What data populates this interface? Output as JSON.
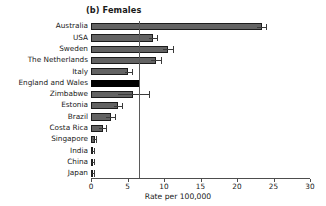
{
  "figure": {
    "panel_title": "(b) Females",
    "background_color": "#ffffff"
  },
  "chart_data": {
    "type": "bar",
    "orientation": "horizontal",
    "title": "(b) Females",
    "xlabel": "Rate  per 100,000",
    "ylabel": "",
    "xlim": [
      0,
      30
    ],
    "xticks": [
      0,
      5,
      10,
      15,
      20,
      25,
      30
    ],
    "xticklabels": [
      "0",
      "5",
      "10",
      "15",
      "20",
      "25",
      "30"
    ],
    "grid": false,
    "legend": false,
    "reference_line": {
      "value": 6.6,
      "orientation": "vertical",
      "color": "#5a5a5a",
      "label": "England and Wales rate"
    },
    "bar_color": "#636363",
    "highlight_color": "#000000",
    "highlight_category": "England and Wales",
    "categories": [
      "Australia",
      "USA",
      "Sweden",
      "The Netherlands",
      "Italy",
      "England and Wales",
      "Zimbabwe",
      "Estonia",
      "Brazil",
      "Costa Rica",
      "Singapore",
      "India",
      "China",
      "Japan"
    ],
    "values": [
      23.4,
      8.5,
      10.6,
      8.9,
      5.1,
      6.6,
      5.8,
      3.7,
      2.7,
      1.6,
      0.5,
      0.3,
      0.3,
      0.3
    ],
    "error_high": [
      24.0,
      9.1,
      11.3,
      9.6,
      5.6,
      6.6,
      7.9,
      4.3,
      3.3,
      2.1,
      0.7,
      0.4,
      0.4,
      0.4
    ],
    "error_low": [
      22.8,
      7.9,
      9.9,
      8.2,
      4.6,
      6.6,
      3.7,
      3.1,
      2.1,
      1.1,
      0.3,
      0.2,
      0.2,
      0.2
    ]
  }
}
